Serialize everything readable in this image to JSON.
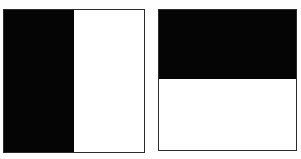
{
  "figure": {
    "background_color": "#fefefe",
    "border_color": "#2b2b2b",
    "black_color": "#050505",
    "white_color": "#ffffff",
    "caption": "",
    "shapes": [
      {
        "name": "vertically-bisected-square",
        "split": "vertical",
        "halves": [
          {
            "position": "left",
            "fill": "black",
            "label": "black-left-half"
          },
          {
            "position": "right",
            "fill": "white",
            "label": "white-right-half"
          }
        ]
      },
      {
        "name": "horizontally-bisected-square",
        "split": "horizontal",
        "halves": [
          {
            "position": "top",
            "fill": "black",
            "label": "black-top-half"
          },
          {
            "position": "bottom",
            "fill": "white",
            "label": "white-bottom-half"
          }
        ]
      }
    ]
  }
}
